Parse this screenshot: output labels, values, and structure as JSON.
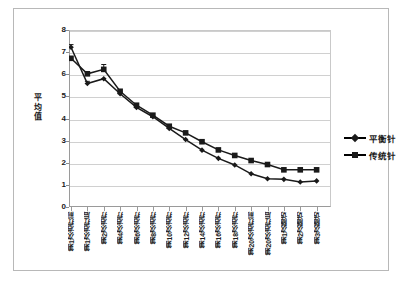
{
  "chart_data": {
    "type": "line",
    "title": "",
    "subtitle": "",
    "xlabel": "",
    "ylabel": "平均值",
    "ylim": [
      0,
      8
    ],
    "ytick_step": 1,
    "yticks": [
      "8",
      "7",
      "6",
      "5",
      "4",
      "3",
      "2",
      "1",
      "0"
    ],
    "grid": true,
    "legend_position": "right",
    "categories": [
      "第1次治疗前",
      "第1次治疗后",
      "第2次治疗",
      "第4次治疗",
      "第6次治疗",
      "第8次治疗",
      "第10次治疗",
      "第12次治疗",
      "第14次治疗",
      "第16次治疗",
      "第18次治疗",
      "第20次治疗前",
      "第20次治疗后",
      "第1次随访",
      "第2次随访",
      "第3次随访"
    ],
    "series": [
      {
        "name": "平衡针",
        "marker": "diamond",
        "color": "#1a1a1a",
        "values": [
          7.22,
          5.58,
          5.8,
          5.12,
          4.5,
          4.08,
          3.55,
          3.05,
          2.57,
          2.2,
          1.9,
          1.5,
          1.28,
          1.25,
          1.13,
          1.18
        ],
        "error": [
          0.12,
          0.1,
          0.0,
          0,
          0,
          0,
          0,
          0,
          0,
          0,
          0,
          0,
          0,
          0,
          0,
          0
        ]
      },
      {
        "name": "传统针",
        "marker": "square",
        "color": "#1a1a1a",
        "values": [
          6.72,
          6.02,
          6.22,
          5.23,
          4.6,
          4.15,
          3.65,
          3.35,
          2.95,
          2.58,
          2.33,
          2.1,
          1.92,
          1.68,
          1.68,
          1.68
        ],
        "error": [
          0.0,
          0.1,
          0.22,
          0,
          0,
          0,
          0,
          0,
          0,
          0,
          0,
          0,
          0,
          0,
          0,
          0
        ]
      }
    ]
  },
  "legend": {
    "items": [
      {
        "label": "平衡针",
        "marker": "diamond"
      },
      {
        "label": "传统针",
        "marker": "square"
      }
    ]
  }
}
